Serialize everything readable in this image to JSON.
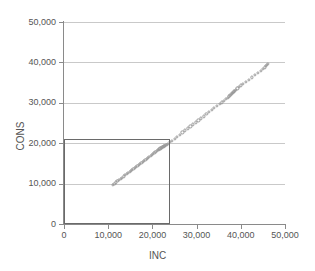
{
  "chart_data": {
    "type": "scatter",
    "title": "",
    "xlabel": "INC",
    "ylabel": "CONS",
    "xlim": [
      0,
      50000
    ],
    "ylim": [
      0,
      50000
    ],
    "x_ticks": [
      "0",
      "10,000",
      "20,000",
      "30,000",
      "40,000",
      "50,000"
    ],
    "x_tick_values": [
      0,
      10000,
      20000,
      30000,
      40000,
      50000
    ],
    "y_ticks": [
      "0",
      "10,000",
      "20,000",
      "30,000",
      "40,000",
      "50,000"
    ],
    "y_tick_values": [
      0,
      10000,
      20000,
      30000,
      40000,
      50000
    ],
    "grid": true,
    "grid_axis": "y",
    "legend": false,
    "marker_style": "open-circle",
    "marker_color": "#9a9a9a",
    "axis_color": "#8a8a8a",
    "grid_color": "#c9c9c9",
    "annotation_rect": {
      "label": "reference-rectangle",
      "x0": 0,
      "y0": 0,
      "x1": 24000,
      "y1": 21000,
      "color": "#6a6a6a"
    },
    "series": [
      {
        "name": "INC vs CONS",
        "x": [
          11050,
          11400,
          11750,
          12100,
          12450,
          12800,
          13150,
          13500,
          13850,
          14200,
          14500,
          14850,
          15100,
          15400,
          15700,
          16000,
          16300,
          16600,
          16900,
          17200,
          17500,
          17800,
          18100,
          18400,
          18700,
          19000,
          19300,
          19600,
          19900,
          20200,
          20450,
          20700,
          20950,
          21200,
          21400,
          21600,
          21800,
          21950,
          22100,
          22250,
          22400,
          22550,
          22700,
          22850,
          23000,
          23200,
          23500,
          23900,
          24400,
          25000,
          25600,
          26200,
          26800,
          27400,
          28000,
          28600,
          29200,
          29800,
          30400,
          31000,
          31600,
          32200,
          32800,
          33400,
          34000,
          34600,
          35200,
          35700,
          36200,
          36600,
          37000,
          37300,
          37550,
          37750,
          37900,
          38050,
          38200,
          38350,
          38500,
          38700,
          38950,
          39250,
          39600,
          40000,
          40500,
          41100,
          41800,
          42500,
          43200,
          43900,
          44500,
          45000,
          45400,
          45700,
          45950,
          46150
        ],
        "y": [
          9700,
          10000,
          10300,
          10600,
          10900,
          11200,
          11500,
          11800,
          12100,
          12400,
          12650,
          12950,
          13200,
          13450,
          13700,
          13950,
          14200,
          14450,
          14700,
          14950,
          15200,
          15450,
          15700,
          15950,
          16200,
          16450,
          16700,
          16950,
          17200,
          17450,
          17650,
          17850,
          18050,
          18250,
          18400,
          18550,
          18700,
          18800,
          18900,
          19000,
          19100,
          19200,
          19300,
          19400,
          19500,
          19650,
          19900,
          20250,
          20650,
          21150,
          21650,
          22150,
          22650,
          23150,
          23650,
          24150,
          24650,
          25150,
          25650,
          26150,
          26650,
          27150,
          27650,
          28150,
          28650,
          29150,
          29650,
          30100,
          30550,
          30950,
          31300,
          31600,
          31850,
          32050,
          32200,
          32350,
          32500,
          32650,
          32800,
          33000,
          33250,
          33550,
          33900,
          34300,
          34700,
          35200,
          35750,
          36300,
          36850,
          37400,
          37900,
          38350,
          38750,
          39100,
          39400,
          39650
        ]
      }
    ]
  },
  "axis_titles": {
    "x": "INC",
    "y": "CONS"
  }
}
